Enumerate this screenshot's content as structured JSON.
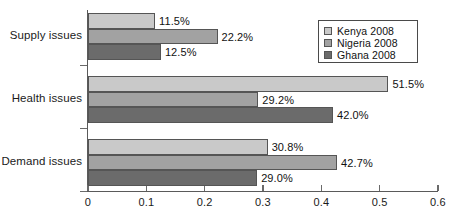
{
  "chart_data": {
    "type": "bar",
    "orientation": "horizontal",
    "title": "",
    "xlabel": "",
    "ylabel": "",
    "categories": [
      "Supply issues",
      "Health issues",
      "Demand issues"
    ],
    "series": [
      {
        "name": "Kenya 2008",
        "color": "#c9c9c9",
        "values": [
          0.115,
          0.515,
          0.308
        ],
        "labels": [
          "11.5%",
          "51.5%",
          "30.8%"
        ]
      },
      {
        "name": "Nigeria 2008",
        "color": "#a2a2a2",
        "values": [
          0.222,
          0.292,
          0.427
        ],
        "labels": [
          "22.2%",
          "29.2%",
          "42.7%"
        ]
      },
      {
        "name": "Ghana 2008",
        "color": "#6b6b6b",
        "values": [
          0.125,
          0.42,
          0.29
        ],
        "labels": [
          "12.5%",
          "42.0%",
          "29.0%"
        ]
      }
    ],
    "xlim": [
      0,
      0.6
    ],
    "xticks": [
      0,
      0.1,
      0.2,
      0.3,
      0.4,
      0.5,
      0.6
    ],
    "xtick_labels": [
      "0",
      "0.1",
      "0.2",
      "0.3",
      "0.4",
      "0.5",
      "0.6"
    ],
    "grid": false,
    "legend_position": "top-right",
    "legend_entries": [
      "Kenya 2008",
      "Nigeria 2008",
      "Ghana 2008"
    ]
  }
}
